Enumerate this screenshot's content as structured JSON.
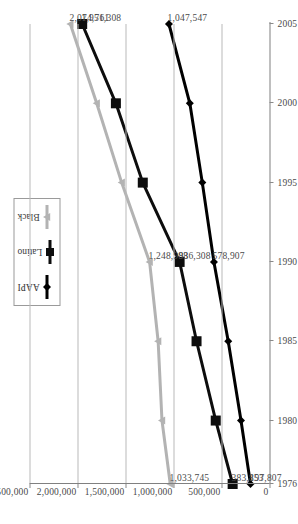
{
  "chart_data": {
    "type": "line",
    "title": "",
    "subtitle": "",
    "xlabel": "",
    "ylabel": "",
    "orientation": "rotated-90-ccw",
    "grid": true,
    "legend_position": "top-center",
    "x": [
      1976,
      1980,
      1985,
      1990,
      1995,
      2000,
      2005
    ],
    "xtick_labels": [
      "1976",
      "1980",
      "1985",
      "1990",
      "1995",
      "2000",
      "2005"
    ],
    "xlim": [
      1976,
      2005
    ],
    "ylim": [
      0,
      2500000
    ],
    "ytick_labels": [
      "2,500,000",
      "2,000,000",
      "1,500,000",
      "1,000,000",
      "500,000",
      "0"
    ],
    "ytick_values": [
      2500000,
      2000000,
      1500000,
      1000000,
      500000,
      0
    ],
    "series": [
      {
        "name": "AAPI",
        "marker": "diamond",
        "color": "#000000",
        "values": [
          197807,
          297000,
          430000,
          578907,
          700000,
          830000,
          1047547
        ]
      },
      {
        "name": "Latino",
        "marker": "square",
        "color": "#0d0d0d",
        "values": [
          383853,
          560000,
          760000,
          936308,
          1320000,
          1600000,
          1951308
        ]
      },
      {
        "name": "Black",
        "marker": "triangle",
        "color": "#b3b3b3",
        "values": [
          1033745,
          1120000,
          1160000,
          1248988,
          1540000,
          1800000,
          2074761
        ]
      }
    ],
    "point_labels": [
      {
        "series": "Black",
        "x": 2005,
        "text": "2,074,761"
      },
      {
        "series": "Latino",
        "x": 2005,
        "text": "1,951,308"
      },
      {
        "series": "AAPI",
        "x": 2005,
        "text": "1,047,547"
      },
      {
        "series": "Black",
        "x": 1990,
        "text": "1,248,988"
      },
      {
        "series": "Latino",
        "x": 1990,
        "text": "936,308"
      },
      {
        "series": "AAPI",
        "x": 1990,
        "text": "578,907"
      },
      {
        "series": "Black",
        "x": 1976,
        "text": "1,033,745"
      },
      {
        "series": "Latino",
        "x": 1976,
        "text": "383,853"
      },
      {
        "series": "AAPI",
        "x": 1976,
        "text": "197,807"
      }
    ]
  },
  "legend": {
    "items": [
      {
        "label": "AAPI",
        "color": "#000000",
        "marker": "diamond"
      },
      {
        "label": "Latino",
        "color": "#0d0d0d",
        "marker": "square"
      },
      {
        "label": "Black",
        "color": "#b3b3b3",
        "marker": "triangle"
      }
    ]
  }
}
